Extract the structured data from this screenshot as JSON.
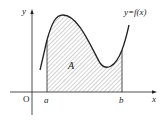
{
  "diagram": {
    "curve_label": "y=f(x)",
    "region_label": "A",
    "origin_label": "O",
    "x_axis_label": "x",
    "y_axis_label": "y",
    "lower_bound_label": "a",
    "upper_bound_label": "b",
    "colors": {
      "stroke": "#222222",
      "hatch": "#555555",
      "background": "#ffffff"
    }
  }
}
